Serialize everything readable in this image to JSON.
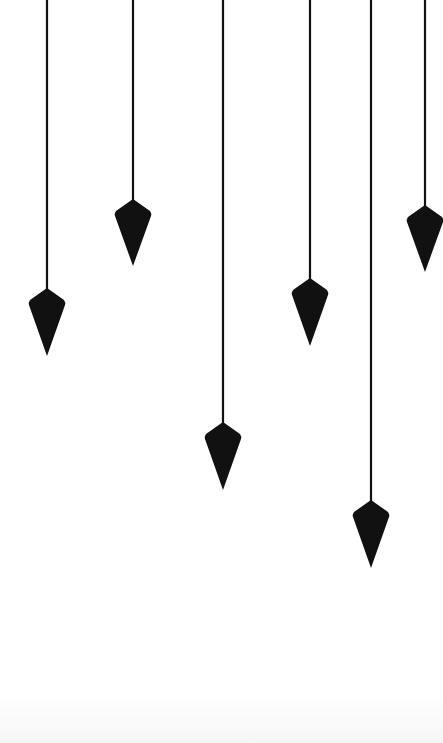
{
  "illustration": {
    "subject": "hanging pendulums",
    "background_color": "#ffffff",
    "ink_color": "#111111",
    "pendulums": [
      {
        "id": 1,
        "shape": "plumb-bob"
      },
      {
        "id": 2,
        "shape": "plumb-bob"
      },
      {
        "id": 3,
        "shape": "plumb-bob"
      },
      {
        "id": 4,
        "shape": "plumb-bob"
      },
      {
        "id": 5,
        "shape": "plumb-bob"
      },
      {
        "id": 6,
        "shape": "plumb-bob"
      }
    ]
  }
}
